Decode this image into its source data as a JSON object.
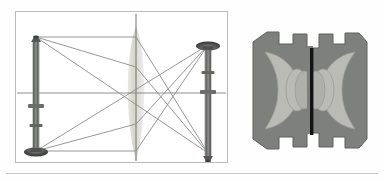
{
  "figure": {
    "panels": [
      {
        "id": "ray-diagram",
        "label": "Ray diagram: converging lens forming a real inverted image",
        "frame": {
          "x": 15,
          "y": 11,
          "width": 213,
          "height": 152,
          "border_color": "#b9bdb9"
        },
        "optical_axis": {
          "y": 92,
          "x_start": 17,
          "x_end": 226,
          "color": "#8c8f8c"
        },
        "lens_axis": {
          "x": 135,
          "y_start": 13,
          "y_end": 161,
          "color": "#6f726f"
        },
        "elements": [
          {
            "name": "object-candlestick",
            "role": "object",
            "orientation": "upright",
            "x": 32,
            "base_y": 152,
            "tip_y": 36,
            "color": "#6a6d6a"
          },
          {
            "name": "converging-lens",
            "role": "lens",
            "type": "biconvex",
            "center_x": 135,
            "half_height": 74,
            "half_width": 11,
            "fill": "#dcdcd4"
          },
          {
            "name": "image-candlestick",
            "role": "image",
            "orientation": "inverted",
            "x": 206,
            "base_y": 152,
            "tip_y": 44,
            "color": "#6a6d6a"
          }
        ],
        "rays": [
          {
            "name": "ray-parallel-top",
            "color": "#8a8d8a",
            "points": "34,36 135,36 207,152"
          },
          {
            "name": "ray-through-center",
            "color": "#8a8d8a",
            "points": "34,36 207,152"
          },
          {
            "name": "ray-focal-lower",
            "color": "#8a8d8a",
            "points": "34,36 135,66 207,152"
          },
          {
            "name": "ray-base-axis",
            "color": "#8a8d8a",
            "points": "34,150 135,150 207,44"
          },
          {
            "name": "ray-base-cross",
            "color": "#8a8d8a",
            "points": "34,150 207,44"
          },
          {
            "name": "ray-base-upper",
            "color": "#8a8d8a",
            "points": "34,150 135,122 207,44"
          }
        ]
      },
      {
        "id": "objective-cross-section",
        "label": "Cross-section of a compound photographic objective with central stop",
        "frame": {
          "x": 249,
          "y": 28,
          "width": 122,
          "height": 125
        },
        "colors": {
          "mount_dark": "#7e807d",
          "glass_light": "#b9bbb4",
          "glass_mid": "#a9aba4",
          "stop_black": "#131313",
          "outline": "#63655f"
        },
        "elements": [
          {
            "name": "lens-barrel-body",
            "role": "mount",
            "fill": "#7e807d"
          },
          {
            "name": "front-group-glass",
            "role": "glass-element",
            "fill": "#b9bbb4"
          },
          {
            "name": "rear-group-glass",
            "role": "glass-element",
            "fill": "#b9bbb4"
          },
          {
            "name": "front-inner-lens",
            "role": "glass-element",
            "fill": "#b9bbb4"
          },
          {
            "name": "rear-inner-lens",
            "role": "glass-element",
            "fill": "#b9bbb4"
          },
          {
            "name": "aperture-stop",
            "role": "diaphragm",
            "fill": "#131313",
            "x": 312,
            "y_top": 48,
            "y_bottom": 135,
            "width": 3
          }
        ]
      }
    ],
    "rule": {
      "name": "bottom-separator",
      "color": "#c9ccc9",
      "y": 173
    }
  }
}
